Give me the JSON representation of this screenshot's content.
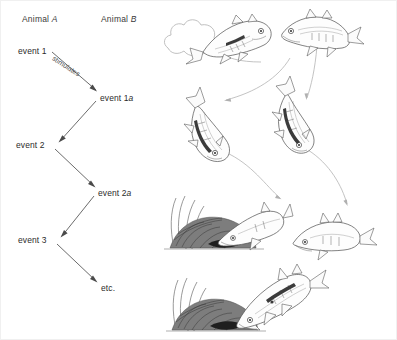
{
  "figure": {
    "width": 397,
    "height": 340,
    "background": "#ffffff",
    "border_color": "#f0f0f0"
  },
  "diagram": {
    "type": "reaction-chain-flow",
    "columns": [
      {
        "id": "col-a",
        "label_plain": "Animal ",
        "label_italic": "A",
        "x": 22,
        "y": 14
      },
      {
        "id": "col-b",
        "label_plain": "Animal ",
        "label_italic": "B",
        "x": 101,
        "y": 14
      }
    ],
    "nodes": [
      {
        "id": "event-1",
        "label_plain": "event 1",
        "label_italic": "",
        "column": "col-a",
        "x": 18,
        "y": 46,
        "anchor_x": 56,
        "anchor_y": 53
      },
      {
        "id": "event-1a",
        "label_plain": "event 1",
        "label_italic": "a",
        "column": "col-b",
        "x": 100,
        "y": 93,
        "anchor_x": 98,
        "anchor_y": 100
      },
      {
        "id": "event-2",
        "label_plain": "event 2",
        "label_italic": "",
        "column": "col-a",
        "x": 16,
        "y": 140,
        "anchor_x": 57,
        "anchor_y": 147
      },
      {
        "id": "event-2a",
        "label_plain": "event 2",
        "label_italic": "a",
        "column": "col-b",
        "x": 98,
        "y": 188,
        "anchor_x": 96,
        "anchor_y": 195
      },
      {
        "id": "event-3",
        "label_plain": "event 3",
        "label_italic": "",
        "column": "col-a",
        "x": 18,
        "y": 235,
        "anchor_x": 58,
        "anchor_y": 242
      },
      {
        "id": "etc",
        "label_plain": "etc.",
        "label_italic": "",
        "column": "col-b",
        "x": 101,
        "y": 283,
        "anchor_x": 99,
        "anchor_y": 289
      }
    ],
    "edges": [
      {
        "from": "event-1",
        "to": "event-1a",
        "label": "stimulates",
        "label_x": 53,
        "label_y": 54,
        "label_rotation": 33
      },
      {
        "from": "event-1a",
        "to": "event-2",
        "label": ""
      },
      {
        "from": "event-2",
        "to": "event-2a",
        "label": ""
      },
      {
        "from": "event-2a",
        "to": "event-3",
        "label": ""
      },
      {
        "from": "event-3",
        "to": "etc",
        "label": ""
      }
    ],
    "arrow_color": "#5a5a5a",
    "text_color": "#2b2b2b"
  },
  "illustration": {
    "title": "stickleback courtship reaction chain sketches",
    "style": "pencil line drawing",
    "line_color": "#4e4e4e",
    "connector_color": "#b4b4b4",
    "scenes": [
      {
        "id": "scene-1",
        "name": "male-zigzag-dance",
        "fish_count": 1,
        "has_cloud": true,
        "has_nest": false
      },
      {
        "id": "scene-2",
        "name": "female-approach",
        "fish_count": 1,
        "has_cloud": false,
        "has_nest": false
      },
      {
        "id": "scene-3",
        "name": "male-head-down-lead",
        "fish_count": 1,
        "has_cloud": false,
        "has_nest": false
      },
      {
        "id": "scene-4",
        "name": "female-follows",
        "fish_count": 1,
        "has_cloud": false,
        "has_nest": false
      },
      {
        "id": "scene-5",
        "name": "male-shows-nest-entrance",
        "fish_count": 2,
        "has_cloud": false,
        "has_nest": true
      },
      {
        "id": "scene-6",
        "name": "female-enters-nest",
        "fish_count": 2,
        "has_cloud": false,
        "has_nest": true
      }
    ]
  }
}
